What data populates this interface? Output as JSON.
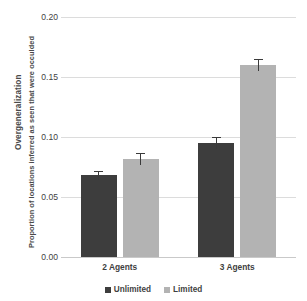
{
  "chart_data": {
    "type": "bar",
    "title": "",
    "xlabel": "",
    "ylabel": "Proportion of locations inferred as seen that were occulded",
    "ylabel_outer": "Overgeneralization",
    "categories": [
      "2 Agents",
      "3 Agents"
    ],
    "series": [
      {
        "name": "Unlimited",
        "color": "#3d3d3d",
        "values": [
          0.068,
          0.095
        ],
        "errors": [
          0.004,
          0.005
        ]
      },
      {
        "name": "Limited",
        "color": "#b3b3b3",
        "values": [
          0.082,
          0.16
        ],
        "errors": [
          0.005,
          0.005
        ]
      }
    ],
    "ylim": [
      0.0,
      0.2
    ],
    "yticks": [
      0.0,
      0.05,
      0.1,
      0.15,
      0.2
    ],
    "ytick_labels": [
      "0.00",
      "0.05",
      "0.10",
      "0.15",
      "0.20"
    ],
    "grid": true,
    "legend_position": "bottom",
    "error_bars": true,
    "background": "#ffffff",
    "gridline_color": "#dcdcdc"
  }
}
